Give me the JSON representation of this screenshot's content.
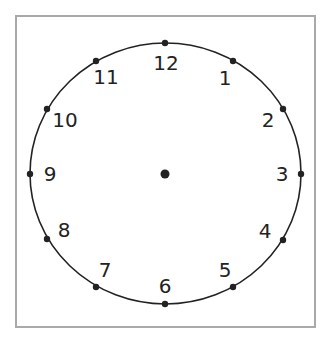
{
  "diagram": {
    "type": "clock-face",
    "colors": {
      "frame": "#a9a9a9",
      "stroke": "#222222",
      "background": "#ffffff"
    },
    "numerals": [
      {
        "hour": 12,
        "label": "12"
      },
      {
        "hour": 1,
        "label": "1"
      },
      {
        "hour": 2,
        "label": "2"
      },
      {
        "hour": 3,
        "label": "3"
      },
      {
        "hour": 4,
        "label": "4"
      },
      {
        "hour": 5,
        "label": "5"
      },
      {
        "hour": 6,
        "label": "6"
      },
      {
        "hour": 7,
        "label": "7"
      },
      {
        "hour": 8,
        "label": "8"
      },
      {
        "hour": 9,
        "label": "9"
      },
      {
        "hour": 10,
        "label": "10"
      },
      {
        "hour": 11,
        "label": "11"
      }
    ]
  }
}
